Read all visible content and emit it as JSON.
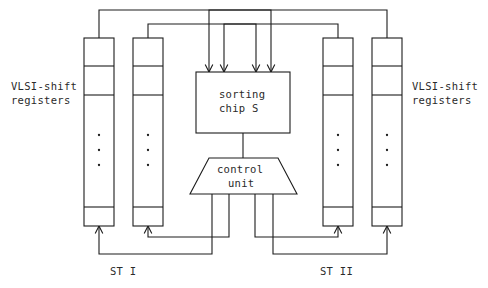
{
  "diagram": {
    "stroke_color": "#1c1c1c",
    "text_color": "#2a2a2a",
    "background_color": "#ffffff",
    "labels": {
      "left_registers_line1": "VLSI-shift",
      "left_registers_line2": "registers",
      "right_registers_line1": "VLSI-shift",
      "right_registers_line2": "registers",
      "sorting_chip_line1": "sorting",
      "sorting_chip_line2": "chip  S",
      "control_unit_line1": "control",
      "control_unit_line2": "unit",
      "stream_left": "ST I",
      "stream_right": "ST II"
    },
    "blocks": {
      "sorting_chip": {
        "name": "sorting chip S",
        "x": 196,
        "y": 72,
        "w": 94,
        "h": 61
      },
      "control_unit": {
        "name": "control unit",
        "top_left_x": 209,
        "top_right_x": 278,
        "bottom_left_x": 190,
        "bottom_right_x": 297,
        "top_y": 158,
        "bottom_y": 194
      }
    },
    "registers": [
      {
        "name": "register-1",
        "x": 84,
        "y": 38,
        "w": 30,
        "h": 188,
        "group": "left"
      },
      {
        "name": "register-2",
        "x": 133,
        "y": 38,
        "w": 30,
        "h": 188,
        "group": "left"
      },
      {
        "name": "register-3",
        "x": 323,
        "y": 38,
        "w": 30,
        "h": 188,
        "group": "right"
      },
      {
        "name": "register-4",
        "x": 372,
        "y": 38,
        "w": 30,
        "h": 188,
        "group": "right"
      }
    ],
    "register_cell_dividers_y": [
      66,
      95,
      207
    ],
    "register_dots_y": [
      135,
      150,
      165
    ],
    "input_arrow_x": [
      209,
      224,
      256,
      271
    ],
    "input_arrow_tip_y": 72,
    "control_output_x": [
      212,
      229,
      255,
      273
    ],
    "bottom_arrow_x": [
      99,
      148,
      338,
      387
    ],
    "bottom_arrow_tip_y": 226
  }
}
